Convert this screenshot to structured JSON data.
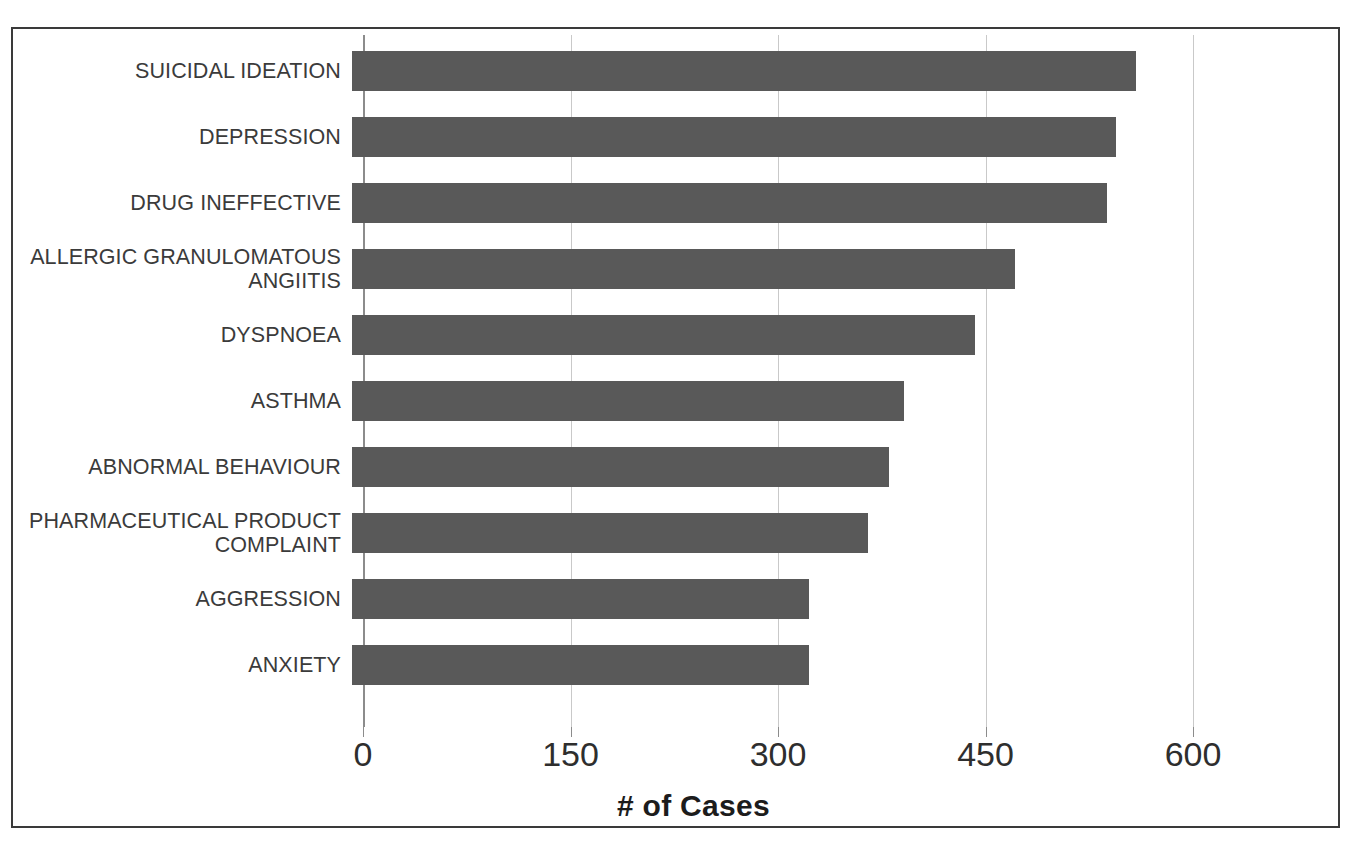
{
  "chart_data": {
    "type": "bar",
    "orientation": "horizontal",
    "title": "",
    "xlabel": "# of Cases",
    "ylabel": "",
    "xlim": [
      0,
      600
    ],
    "xticks": [
      0,
      150,
      300,
      450,
      600
    ],
    "xtick_labels": [
      "0",
      "150",
      "300",
      "450",
      "600"
    ],
    "grid": true,
    "legend": false,
    "bar_color": "#595959",
    "gridline_color": "#c9c9c9",
    "categories": [
      "SUICIDAL IDEATION",
      "DEPRESSION",
      "DRUG INEFFECTIVE",
      "ALLERGIC GRANULOMATOUS\nANGIITIS",
      "DYSPNOEA",
      "ASTHMA",
      "ABNORMAL BEHAVIOUR",
      "PHARMACEUTICAL PRODUCT\nCOMPLAINT",
      "AGGRESSION",
      "ANXIETY"
    ],
    "values": [
      567,
      552,
      546,
      479,
      450,
      399,
      388,
      373,
      330,
      330
    ]
  },
  "axis": {
    "x_title": "# of Cases"
  }
}
